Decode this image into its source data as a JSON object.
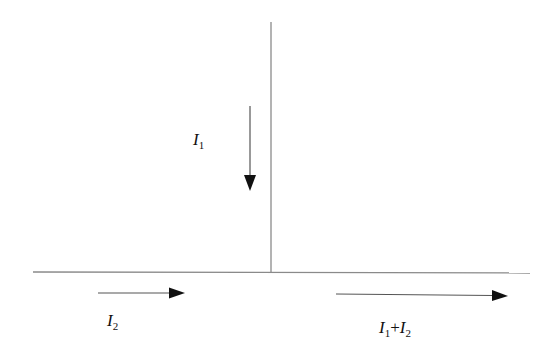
{
  "diagram": {
    "type": "current-junction",
    "colors": {
      "wire": "#8a8a8a",
      "arrow": "#111111",
      "background": "#ffffff"
    },
    "wires": [
      {
        "name": "vertical-wire",
        "x1": 271,
        "y1": 22,
        "x2": 271,
        "y2": 272
      },
      {
        "name": "horizontal-wire",
        "x1": 33,
        "y1": 272,
        "x2": 530,
        "y2": 273
      }
    ],
    "arrows": [
      {
        "name": "arrow-i1",
        "direction": "down",
        "x1": 250,
        "y1": 106,
        "x2": 250,
        "y2": 190
      },
      {
        "name": "arrow-i2",
        "direction": "right",
        "x1": 98,
        "y1": 293,
        "x2": 185,
        "y2": 293
      },
      {
        "name": "arrow-sum",
        "direction": "right",
        "x1": 336,
        "y1": 294,
        "x2": 508,
        "y2": 296
      }
    ],
    "labels": {
      "i1": {
        "var": "I",
        "sub": "1"
      },
      "i2": {
        "var": "I",
        "sub": "2"
      },
      "sum": {
        "var1": "I",
        "sub1": "1",
        "op": "+",
        "var2": "I",
        "sub2": "2"
      }
    }
  }
}
